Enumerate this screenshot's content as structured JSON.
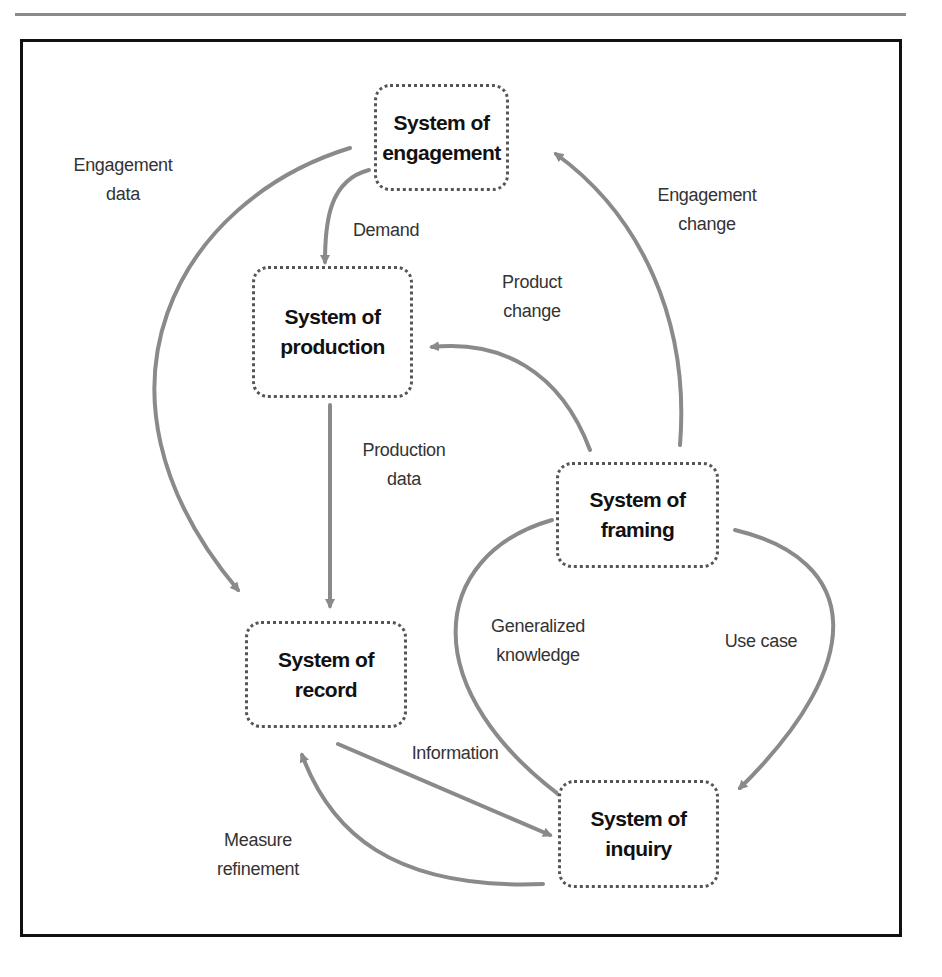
{
  "diagram": {
    "nodes": {
      "engagement": {
        "line1": "System of",
        "line2": "engagement"
      },
      "production": {
        "line1": "System of",
        "line2": "production"
      },
      "framing": {
        "line1": "System of",
        "line2": "framing"
      },
      "record": {
        "line1": "System of",
        "line2": "record"
      },
      "inquiry": {
        "line1": "System of",
        "line2": "inquiry"
      }
    },
    "edges": {
      "engagement_data": {
        "line1": "Engagement",
        "line2": "data",
        "from": "System of engagement",
        "to": "System of record"
      },
      "demand": {
        "line1": "Demand",
        "from": "System of engagement",
        "to": "System of production"
      },
      "engagement_change": {
        "line1": "Engagement",
        "line2": "change",
        "from": "System of framing",
        "to": "System of engagement"
      },
      "product_change": {
        "line1": "Product",
        "line2": "change",
        "from": "System of framing",
        "to": "System of production"
      },
      "production_data": {
        "line1": "Production",
        "line2": "data",
        "from": "System of production",
        "to": "System of record"
      },
      "generalized_knowledge": {
        "line1": "Generalized",
        "line2": "knowledge",
        "from": "System of framing",
        "to": "System of inquiry"
      },
      "use_case": {
        "line1": "Use case",
        "from": "System of framing",
        "to": "System of inquiry"
      },
      "information": {
        "line1": "Information",
        "from": "System of record",
        "to": "System of inquiry"
      },
      "measure_refinement": {
        "line1": "Measure",
        "line2": "refinement",
        "from": "System of inquiry",
        "to": "System of record"
      }
    },
    "colors": {
      "arrow": "#8a8a8a",
      "frame": "#111111",
      "node_border": "#555555",
      "text": "#111111"
    }
  }
}
